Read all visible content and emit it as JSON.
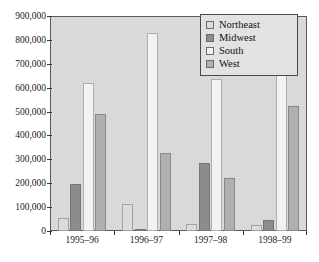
{
  "chart_data": {
    "type": "bar",
    "title": "",
    "subtitle": "",
    "xlabel": "",
    "ylabel": "",
    "categories": [
      "1995–96",
      "1996–97",
      "1997–98",
      "1998–99"
    ],
    "series": [
      {
        "name": "Northeast",
        "color": "#dcdcdc",
        "values": [
          55000,
          115000,
          30000,
          25000
        ]
      },
      {
        "name": "Midwest",
        "color": "#8c8c8c",
        "values": [
          197000,
          10000,
          285000,
          45000
        ]
      },
      {
        "name": "South",
        "color": "#f2f2f2",
        "values": [
          620000,
          830000,
          635000,
          810000
        ]
      },
      {
        "name": "West",
        "color": "#b0b0b0",
        "values": [
          490000,
          325000,
          220000,
          525000
        ]
      }
    ],
    "ylim": [
      0,
      900000
    ],
    "yticks": [
      0,
      100000,
      200000,
      300000,
      400000,
      500000,
      600000,
      700000,
      800000,
      900000
    ],
    "ytick_labels": [
      "0",
      "100,000",
      "200,000",
      "300,000",
      "400,000",
      "500,000",
      "600,000",
      "700,000",
      "800,000",
      "900,000"
    ],
    "grid": false,
    "legend_position": "top-right",
    "plot_background": "#d9d9d9",
    "axis_color": "#5a5a5a"
  },
  "legend": {
    "items": [
      {
        "label": "Northeast"
      },
      {
        "label": "Midwest"
      },
      {
        "label": "South"
      },
      {
        "label": "West"
      }
    ]
  }
}
